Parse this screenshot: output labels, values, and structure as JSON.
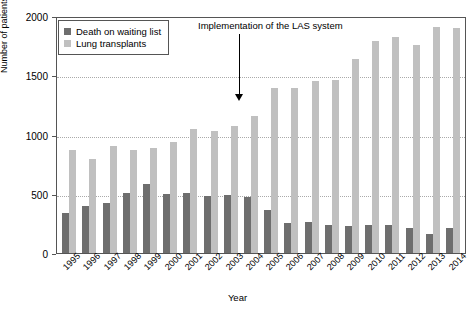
{
  "chart_data": {
    "type": "bar",
    "title": "",
    "xlabel": "Year",
    "ylabel": "Number of patients",
    "ylim": [
      0,
      2000
    ],
    "yticks": [
      0,
      500,
      1000,
      1500,
      2000
    ],
    "grid": true,
    "legend_position": "top-left",
    "categories": [
      "1995",
      "1996",
      "1997",
      "1998",
      "1999",
      "2000",
      "2001",
      "2002",
      "2003",
      "2004",
      "2005",
      "2006",
      "2007",
      "2008",
      "2009",
      "2010",
      "2011",
      "2012",
      "2013",
      "2014"
    ],
    "series": [
      {
        "name": "Death on waiting list",
        "color": "#6e6e6e",
        "values": [
          340,
          395,
          425,
          505,
          580,
          500,
          505,
          480,
          490,
          475,
          365,
          250,
          265,
          235,
          225,
          235,
          235,
          215,
          160,
          215
        ]
      },
      {
        "name": "Lung transplants",
        "color": "#c0c0c0",
        "values": [
          870,
          795,
          905,
          870,
          890,
          940,
          1050,
          1030,
          1075,
          1160,
          1390,
          1390,
          1455,
          1460,
          1640,
          1790,
          1820,
          1755,
          1910,
          1900
        ]
      }
    ],
    "annotations": [
      {
        "text": "Implementation of the LAS system",
        "points_to_category": "2005"
      }
    ]
  },
  "axes": {
    "y_label": "Number of patients",
    "x_label": "Year",
    "y_ticks": [
      "2000",
      "1500",
      "1000",
      "500",
      "0"
    ]
  },
  "legend": {
    "items": [
      {
        "label": "Death on waiting list",
        "swatch": "dark-gray"
      },
      {
        "label": "Lung transplants",
        "swatch": "light-gray"
      }
    ]
  },
  "annotation": {
    "text": "Implementation of the LAS system"
  }
}
